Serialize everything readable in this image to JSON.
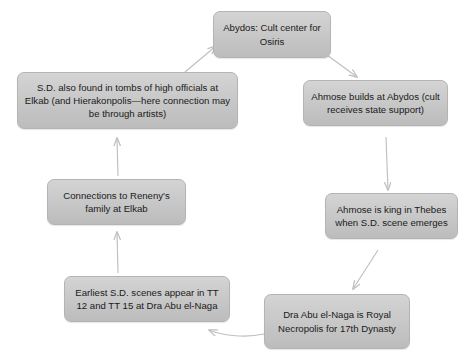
{
  "diagram": {
    "type": "cycle-flowchart",
    "background_color": "#ffffff",
    "node_fill_color": "#c9c9c9",
    "node_border_color": "#b4b4b4",
    "arrow_color": "#bfbfbf",
    "text_color": "#1a1a1a",
    "nodes": [
      {
        "id": "abydos",
        "label": "Abydos: Cult center for Osiris"
      },
      {
        "id": "ahmose_builds",
        "label": "Ahmose builds at Abydos (cult receives state support)"
      },
      {
        "id": "ahmose_king",
        "label": "Ahmose is king in Thebes when S.D. scene emerges"
      },
      {
        "id": "dra_abu",
        "label": "Dra Abu el-Naga is Royal Necropolis for 17th Dynasty"
      },
      {
        "id": "earliest_sd",
        "label": "Earliest S.D. scenes appear in TT 12 and TT 15 at Dra Abu el-Naga"
      },
      {
        "id": "reneny",
        "label": "Connections to Reneny's family at Elkab"
      },
      {
        "id": "sd_officials",
        "label": "S.D. also found in tombs of high officials at Elkab (and Hierakonpolis—here connection may be through artists)"
      }
    ],
    "edges": [
      {
        "from": "abydos",
        "to": "ahmose_builds",
        "style": "diagonal-down-right"
      },
      {
        "from": "ahmose_builds",
        "to": "ahmose_king",
        "style": "vertical-down"
      },
      {
        "from": "ahmose_king",
        "to": "dra_abu",
        "style": "diagonal-down-left"
      },
      {
        "from": "dra_abu",
        "to": "earliest_sd",
        "style": "curved-left"
      },
      {
        "from": "earliest_sd",
        "to": "reneny",
        "style": "vertical-up"
      },
      {
        "from": "reneny",
        "to": "sd_officials",
        "style": "vertical-up"
      },
      {
        "from": "sd_officials",
        "to": "abydos",
        "style": "diagonal-up-right"
      }
    ]
  }
}
